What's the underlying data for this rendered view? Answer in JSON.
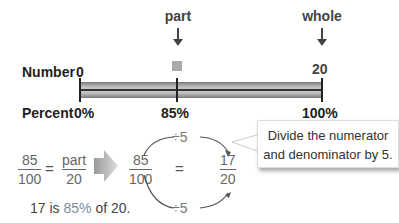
{
  "number_line": {
    "row_labels": {
      "number": "Number",
      "percent": "Percent"
    },
    "top_labels": {
      "part": "part",
      "whole": "whole"
    },
    "number_ticks": {
      "start": "0",
      "whole": "20"
    },
    "percent_ticks": {
      "start": "0%",
      "part": "85%",
      "whole": "100%"
    }
  },
  "equation": {
    "left_fraction": {
      "numerator": "85",
      "denominator": "100"
    },
    "equals": "=",
    "right_fraction": {
      "numerator": "part",
      "denominator": "20"
    }
  },
  "simplification": {
    "from_fraction": {
      "numerator": "85",
      "denominator": "100"
    },
    "equals": "=",
    "to_fraction": {
      "numerator": "17",
      "denominator": "20"
    },
    "top_operation": "÷5",
    "bottom_operation": "÷5"
  },
  "callout": {
    "line1": "Divide the numerator",
    "line2": "and denominator by 5."
  },
  "caption": {
    "pre": "17 is ",
    "highlight": "85%",
    "post": " of 20."
  },
  "colors": {
    "highlight": "#7a8fa0",
    "marker": "#aaaaaa",
    "arrow": "#bbbbbb"
  }
}
